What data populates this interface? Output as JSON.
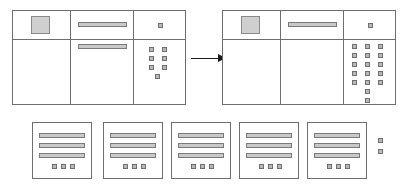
{
  "diagram": {
    "type": "wireframe-flow",
    "colors": {
      "outline": "#6e6e6e",
      "fill_light": "#cfcfcf",
      "fill_bar": "#c9c9c9",
      "fill_square": "#b9b9b9",
      "arrow": "#1a1a1a",
      "background": "#ffffff"
    },
    "before_panel": {
      "name": "before-layout",
      "label": "",
      "columns": 3,
      "rows": 2,
      "thumbnail": {
        "name": "image-placeholder",
        "label": ""
      },
      "text_bars": [
        {
          "name": "headline-bar-top",
          "label": "",
          "row": 1,
          "column": 2
        },
        {
          "name": "headline-bar-bottom",
          "label": "",
          "row": 2,
          "column": 2
        }
      ],
      "marker_top": {
        "name": "result-marker",
        "count": 1
      },
      "marker_grid": {
        "name": "result-marker-grid",
        "columns": 2,
        "rows": 3,
        "extra_centered": 1,
        "total": 7
      }
    },
    "arrow": {
      "name": "transformation-arrow",
      "direction": "right",
      "label": ""
    },
    "after_panel": {
      "name": "after-layout",
      "label": "",
      "columns": 3,
      "rows": 2,
      "thumbnail": {
        "name": "image-placeholder",
        "label": ""
      },
      "text_bars": [
        {
          "name": "headline-bar-top",
          "label": "",
          "row": 1,
          "column": 2
        }
      ],
      "marker_top": {
        "name": "result-marker",
        "count": 1
      },
      "marker_grid": {
        "name": "result-marker-grid",
        "columns": 3,
        "rows": 5,
        "extra_centered": 2,
        "total": 17
      }
    },
    "result_cards": {
      "name": "result-card-row",
      "count": 5,
      "items": [
        {
          "name": "result-card-1",
          "label": "",
          "bars": 3,
          "markers": 3
        },
        {
          "name": "result-card-2",
          "label": "",
          "bars": 3,
          "markers": 3
        },
        {
          "name": "result-card-3",
          "label": "",
          "bars": 3,
          "markers": 3
        },
        {
          "name": "result-card-4",
          "label": "",
          "bars": 3,
          "markers": 3
        },
        {
          "name": "result-card-5",
          "label": "",
          "bars": 3,
          "markers": 3
        }
      ]
    },
    "trailing_markers": {
      "name": "overflow-markers",
      "count": 2,
      "orientation": "vertical"
    }
  }
}
